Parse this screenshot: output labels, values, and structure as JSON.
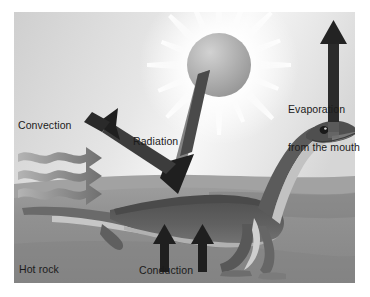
{
  "figure": {
    "width": 370,
    "height": 297
  },
  "labels": {
    "convection": "Convection",
    "radiation": "Radiation",
    "evaporation_line1": "Evaporation",
    "evaporation_line2": "from the mouth",
    "conduction": "Conduction",
    "hot_rock": "Hot rock"
  },
  "icons": {
    "sun": "sun-icon",
    "lizard": "lizard-icon",
    "evaporation_arrow": "arrow-up-icon",
    "radiation_incoming_arrow": "arrow-down-right-icon",
    "radiation_outgoing_arrow": "arrow-up-left-icon",
    "convection_waves": "wavy-arrow-right-icon",
    "conduction_arrow_left": "arrow-up-icon",
    "conduction_arrow_right": "arrow-up-icon"
  },
  "colors": {
    "page_background": "#ffffff",
    "sky_light": "#f6f6f6",
    "sky_mid": "#dcdcdc",
    "sky_edge": "#cfcfcf",
    "sun_body": "#a9a9a9",
    "sun_highlight": "#cccccc",
    "sun_rays": "#ffffff",
    "ground": "#8d8d8d",
    "ground_far": "#9b9b9b",
    "ground_shadow": "#7d7d7d",
    "lizard_dark": "#585858",
    "lizard_mid": "#6e6e6e",
    "lizard_belly": "#bdbdbd",
    "lizard_light": "#d9d9d9",
    "arrow_dark": "#202020",
    "arrow_grey": "#8a8a8a",
    "text": "#1b1b1b"
  }
}
